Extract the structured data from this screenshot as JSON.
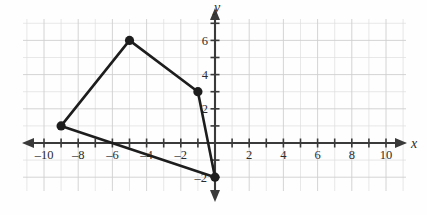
{
  "figure": {
    "type": "coordinate-plane",
    "x_axis_label": "x",
    "y_axis_label": "y"
  },
  "chart_data": {
    "type": "scatter",
    "title": "",
    "subtitle": "",
    "xlabel": "x",
    "ylabel": "y",
    "xlim": [
      -11.2,
      11.2
    ],
    "ylim": [
      -3.2,
      7.3
    ],
    "grid": true,
    "grid_minor_step": 1,
    "grid_major_step": 2,
    "legend": "none",
    "x_tick_labels": [
      "-10",
      "-8",
      "-6",
      "-4",
      "-2",
      "2",
      "4",
      "6",
      "8",
      "10"
    ],
    "x_tick_values": [
      -10,
      -8,
      -6,
      -4,
      -2,
      2,
      4,
      6,
      8,
      10
    ],
    "y_tick_labels": [
      "6",
      "4",
      "2",
      "-2"
    ],
    "y_tick_values": [
      6,
      4,
      2,
      -2
    ],
    "x_minor_ticks": [
      -11,
      -10,
      -9,
      -8,
      -7,
      -6,
      -5,
      -4,
      -3,
      -2,
      -1,
      1,
      2,
      3,
      4,
      5,
      6,
      7,
      8,
      9,
      10,
      11
    ],
    "y_minor_ticks": [
      -2,
      -1,
      1,
      2,
      3,
      4,
      5,
      6,
      7
    ],
    "series": [
      {
        "name": "quadrilateral",
        "closed": true,
        "marker": "filled-circle",
        "points": [
          {
            "label": "A",
            "x": -9,
            "y": 1
          },
          {
            "label": "B",
            "x": -5,
            "y": 6
          },
          {
            "label": "C",
            "x": -1,
            "y": 3
          },
          {
            "label": "D",
            "x": 0,
            "y": -2
          }
        ]
      }
    ]
  },
  "style": {
    "axis_color": "#3a3a3a",
    "grid_color": "#dedede",
    "shape_color": "#1d1d1d",
    "label_color": "#2b2b2b",
    "background": "#fefefe"
  }
}
